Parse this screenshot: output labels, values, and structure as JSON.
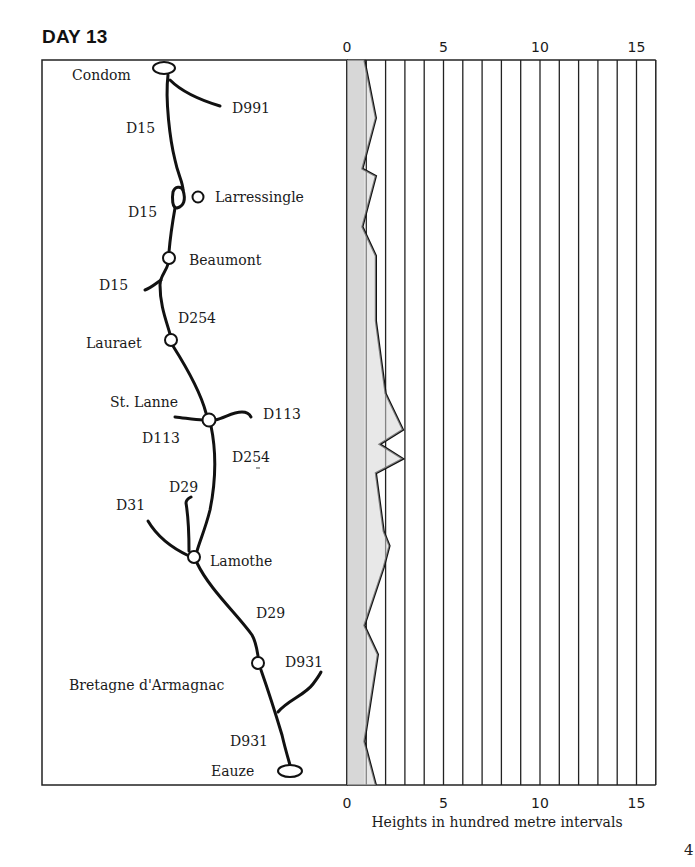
{
  "page": {
    "title": "DAY 13",
    "page_number": "4"
  },
  "map": {
    "places": [
      {
        "name": "Condom",
        "x": 164,
        "y": 68,
        "type": "town-oval",
        "label_x": 72,
        "label_y": 80
      },
      {
        "name": "Larressingle",
        "x": 198,
        "y": 197,
        "type": "village",
        "label_x": 215,
        "label_y": 202
      },
      {
        "name": "Beaumont",
        "x": 169,
        "y": 258,
        "type": "village",
        "label_x": 189,
        "label_y": 265
      },
      {
        "name": "Lauraet",
        "x": 171,
        "y": 340,
        "type": "village",
        "label_x": 86,
        "label_y": 348
      },
      {
        "name": "St. Lanne",
        "x": 209,
        "y": 419,
        "type": "village",
        "label_x": 110,
        "label_y": 407
      },
      {
        "name": "Lamothe",
        "x": 194,
        "y": 557,
        "type": "village",
        "label_x": 210,
        "label_y": 566
      },
      {
        "name": "Bretagne d'Armagnac",
        "x": 258,
        "y": 663,
        "type": "village",
        "label_x": 69,
        "label_y": 690
      },
      {
        "name": "Eauze",
        "x": 290,
        "y": 771,
        "type": "town-oval",
        "label_x": 211,
        "label_y": 776
      }
    ],
    "roads": [
      {
        "name": "D991",
        "label_x": 232,
        "label_y": 113
      },
      {
        "name": "D15",
        "label_x": 126,
        "label_y": 133
      },
      {
        "name": "D15",
        "label_x": 128,
        "label_y": 217
      },
      {
        "name": "D15",
        "label_x": 99,
        "label_y": 290
      },
      {
        "name": "D254",
        "label_x": 178,
        "label_y": 323
      },
      {
        "name": "D113",
        "label_x": 263,
        "label_y": 419
      },
      {
        "name": "D113",
        "label_x": 142,
        "label_y": 443
      },
      {
        "name": "D254",
        "label_x": 232,
        "label_y": 462
      },
      {
        "name": "D29",
        "label_x": 169,
        "label_y": 492
      },
      {
        "name": "D31",
        "label_x": 116,
        "label_y": 510
      },
      {
        "name": "D29",
        "label_x": 256,
        "label_y": 618
      },
      {
        "name": "D931",
        "label_x": 285,
        "label_y": 667
      },
      {
        "name": "D931",
        "label_x": 230,
        "label_y": 746
      }
    ]
  },
  "chart_data": {
    "type": "area",
    "xlabel": "Heights in hundred metre intervals",
    "ylabel": "",
    "x_ticks": [
      "0",
      "5",
      "10",
      "15"
    ],
    "xlim": [
      0,
      16
    ],
    "grid": true,
    "grid_interval": 1,
    "orientation": "vertical-route (top = Condom, bottom = Eauze)",
    "baseline_shaded": [
      0,
      0.9
    ],
    "profile": [
      {
        "pos": 0.0,
        "height": 0.9
      },
      {
        "pos": 0.08,
        "height": 1.5
      },
      {
        "pos": 0.15,
        "height": 0.8
      },
      {
        "pos": 0.16,
        "height": 1.5
      },
      {
        "pos": 0.23,
        "height": 0.8
      },
      {
        "pos": 0.27,
        "height": 1.5
      },
      {
        "pos": 0.36,
        "height": 1.5
      },
      {
        "pos": 0.46,
        "height": 2.0
      },
      {
        "pos": 0.51,
        "height": 2.9
      },
      {
        "pos": 0.53,
        "height": 1.7
      },
      {
        "pos": 0.55,
        "height": 2.9
      },
      {
        "pos": 0.57,
        "height": 1.5
      },
      {
        "pos": 0.65,
        "height": 1.9
      },
      {
        "pos": 0.67,
        "height": 2.2
      },
      {
        "pos": 0.7,
        "height": 1.9
      },
      {
        "pos": 0.78,
        "height": 0.9
      },
      {
        "pos": 0.82,
        "height": 1.6
      },
      {
        "pos": 0.94,
        "height": 0.9
      },
      {
        "pos": 1.0,
        "height": 1.5
      }
    ]
  }
}
